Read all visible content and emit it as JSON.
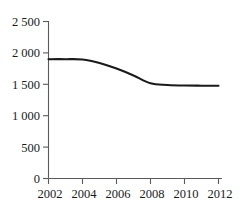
{
  "chart_data": {
    "type": "line",
    "title": "",
    "subtitle": "",
    "xlabel": "",
    "ylabel": "",
    "x": [
      2002,
      2003,
      2004,
      2005,
      2006,
      2007,
      2008,
      2009,
      2010,
      2011,
      2012
    ],
    "categories": [
      "2002",
      "2003",
      "2004",
      "2005",
      "2006",
      "2007",
      "2008",
      "2009",
      "2010",
      "2011",
      "2012"
    ],
    "values": [
      1900,
      1900,
      1895,
      1840,
      1750,
      1640,
      1515,
      1490,
      1480,
      1478,
      1478
    ],
    "series": [
      {
        "name": "",
        "values": [
          1900,
          1900,
          1895,
          1840,
          1750,
          1640,
          1515,
          1490,
          1480,
          1478,
          1478
        ]
      }
    ],
    "xlim": [
      2002,
      2012
    ],
    "ylim": [
      0,
      2500
    ],
    "grid": false,
    "legend": false,
    "legend_position": "none",
    "line_color": "#1a1a1a",
    "axis_color": "#5a5a5a",
    "background_color": "#ffffff",
    "y_ticks": [
      0,
      500,
      1000,
      1500,
      2000,
      2500
    ],
    "y_tick_labels": [
      "0",
      "500",
      "1 000",
      "1 500",
      "2 000",
      "2 500"
    ],
    "x_ticks": [
      2002,
      2004,
      2006,
      2008,
      2010,
      2012
    ],
    "x_tick_labels": [
      "2002",
      "2004",
      "2006",
      "2008",
      "2010",
      "2012"
    ],
    "annotations": []
  }
}
